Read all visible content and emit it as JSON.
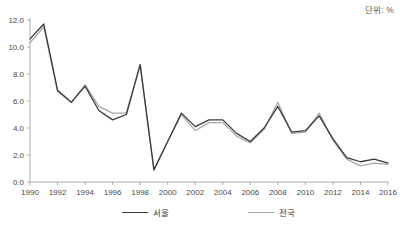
{
  "unit_note": "단위: %",
  "legend": {
    "items": [
      {
        "label": "서울",
        "color": "#3a3a3a"
      },
      {
        "label": "전국",
        "color": "#a8a8a8"
      }
    ]
  },
  "chart_data": {
    "type": "line",
    "title": "",
    "xlabel": "",
    "ylabel": "",
    "unit": "%",
    "grid": false,
    "legend_position": "bottom",
    "xlim": [
      1990,
      2016
    ],
    "ylim": [
      0.0,
      12.0
    ],
    "ytick_values": [
      0.0,
      2.0,
      4.0,
      6.0,
      8.0,
      10.0,
      12.0
    ],
    "ytick_labels": [
      "0.0",
      "2.0",
      "4.0",
      "6.0",
      "8.0",
      "10.0",
      "12.0"
    ],
    "x": [
      1990,
      1991,
      1992,
      1993,
      1994,
      1995,
      1996,
      1997,
      1998,
      1999,
      2000,
      2001,
      2002,
      2003,
      2004,
      2005,
      2006,
      2007,
      2008,
      2009,
      2010,
      2011,
      2012,
      2013,
      2014,
      2015,
      2016
    ],
    "xtick_values": [
      1990,
      1992,
      1994,
      1996,
      1998,
      2000,
      2002,
      2004,
      2006,
      2008,
      2010,
      2012,
      2014,
      2016
    ],
    "xtick_labels": [
      "1990",
      "1992",
      "1994",
      "1996",
      "1998",
      "2000",
      "2002",
      "2004",
      "2006",
      "2008",
      "2010",
      "2012",
      "2014",
      "2016"
    ],
    "series": [
      {
        "name": "서울",
        "color": "#3a3a3a",
        "values": [
          10.6,
          11.7,
          6.8,
          5.9,
          7.1,
          5.3,
          4.6,
          5.0,
          8.7,
          0.9,
          3.0,
          5.1,
          4.1,
          4.6,
          4.6,
          3.6,
          3.0,
          4.0,
          5.6,
          3.7,
          3.8,
          4.9,
          3.2,
          1.8,
          1.5,
          1.7,
          1.4
        ]
      },
      {
        "name": "전국",
        "color": "#a8a8a8",
        "values": [
          10.3,
          11.5,
          6.7,
          5.9,
          7.2,
          5.6,
          5.1,
          5.1,
          8.7,
          0.9,
          3.0,
          5.0,
          3.8,
          4.4,
          4.4,
          3.4,
          2.9,
          3.9,
          5.9,
          3.6,
          3.7,
          5.1,
          3.1,
          1.7,
          1.2,
          1.4,
          1.3
        ]
      }
    ]
  }
}
